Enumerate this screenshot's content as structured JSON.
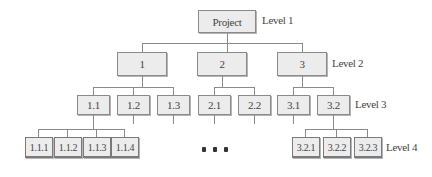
{
  "diagram": {
    "type": "work-breakdown-structure",
    "level_labels": [
      "Level 1",
      "Level 2",
      "Level 3",
      "Level 4"
    ],
    "root": {
      "label": "Project"
    },
    "level2": [
      {
        "label": "1"
      },
      {
        "label": "2"
      },
      {
        "label": "3"
      }
    ],
    "level3": [
      {
        "label": "1.1",
        "parent": "1"
      },
      {
        "label": "1.2",
        "parent": "1"
      },
      {
        "label": "1.3",
        "parent": "1"
      },
      {
        "label": "2.1",
        "parent": "2"
      },
      {
        "label": "2.2",
        "parent": "2"
      },
      {
        "label": "3.1",
        "parent": "3"
      },
      {
        "label": "3.2",
        "parent": "3"
      }
    ],
    "level4": [
      {
        "label": "1.1.1",
        "parent": "1.1"
      },
      {
        "label": "1.1.2",
        "parent": "1.1"
      },
      {
        "label": "1.1.3",
        "parent": "1.1"
      },
      {
        "label": "1.1.4",
        "parent": "1.1"
      },
      {
        "label": "3.2.1",
        "parent": "3.2"
      },
      {
        "label": "3.2.2",
        "parent": "3.2"
      },
      {
        "label": "3.2.3",
        "parent": "3.2"
      }
    ],
    "ellipsis": "• • •"
  }
}
